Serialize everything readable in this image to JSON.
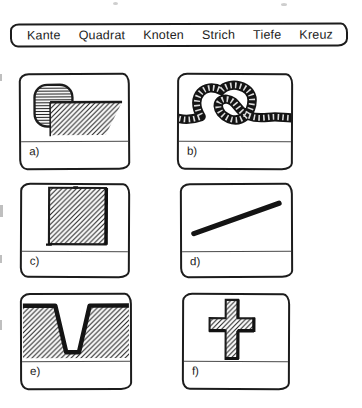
{
  "word_bank": {
    "items": [
      "Kante",
      "Quadrat",
      "Knoten",
      "Strich",
      "Tiefe",
      "Kreuz"
    ]
  },
  "panels": [
    {
      "label": "a)",
      "figure": "rounded-edge-block"
    },
    {
      "label": "b)",
      "figure": "rope-knot"
    },
    {
      "label": "c)",
      "figure": "hatched-square"
    },
    {
      "label": "d)",
      "figure": "diagonal-stroke"
    },
    {
      "label": "e)",
      "figure": "deep-groove-cross-section"
    },
    {
      "label": "f)",
      "figure": "hatched-cross"
    }
  ],
  "colors": {
    "ink": "#1c1c1c",
    "paper": "#ffffff",
    "separator": "#4a4a4a"
  }
}
